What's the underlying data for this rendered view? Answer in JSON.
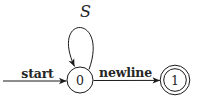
{
  "diagram": {
    "type": "finite-state-automaton",
    "colors": {
      "background": "#ffffff",
      "stroke": "#1b1b1b",
      "text": "#262626"
    },
    "states": [
      {
        "id": "0",
        "label": "0",
        "accepting": false
      },
      {
        "id": "1",
        "label": "1",
        "accepting": true
      }
    ],
    "transitions": [
      {
        "from": null,
        "to": "0",
        "label": "start",
        "kind": "initial-arrow"
      },
      {
        "from": "0",
        "to": "0",
        "label": "S",
        "kind": "self-loop"
      },
      {
        "from": "0",
        "to": "1",
        "label": "newline",
        "kind": "arrow"
      }
    ]
  }
}
